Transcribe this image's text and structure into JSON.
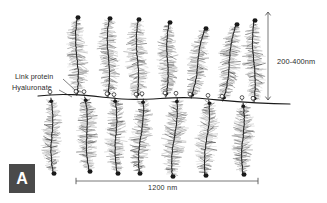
{
  "figure": {
    "panel_label": "A",
    "background_color": "#ffffff",
    "width": 327,
    "height": 203
  },
  "annotations": {
    "link_protein_label": "Link protein",
    "hyaluronate_label": "Hyaluronate",
    "vertical_scale_label": "200-400nm",
    "horizontal_scale_label": "1200 nm"
  },
  "colors": {
    "ink": "#1a1a1a",
    "bristle": "#8c8c8c",
    "core": "#262626",
    "scale_line": "#555555",
    "panel_box": "#4a4a4a",
    "panel_text": "#ffffff",
    "label_text": "#2b2b2b"
  },
  "scalebars": {
    "vertical": {
      "label": "200-400nm",
      "x": 268,
      "y_top": 12,
      "y_bottom": 100
    },
    "horizontal": {
      "label": "1200 nm",
      "y": 181,
      "x_left": 76,
      "x_right": 258
    }
  },
  "backbone": {
    "name": "hyaluronate-chain",
    "path": "M 38,96 C 70,92 96,97 122,99 C 150,101 170,96 196,98 C 222,100 248,104 290,104",
    "attachment_count": 14
  },
  "monomers": {
    "upper_count": 7,
    "lower_count": 7,
    "upper": [
      {
        "id": "upper-1",
        "base_x": 76,
        "base_y": 95,
        "top_x": 78,
        "top_y": 17,
        "tilt": 2,
        "bristle_span": 11
      },
      {
        "id": "upper-2",
        "base_x": 107,
        "base_y": 97,
        "top_x": 110,
        "top_y": 18,
        "tilt": 3,
        "bristle_span": 11
      },
      {
        "id": "upper-3",
        "base_x": 136,
        "base_y": 98,
        "top_x": 139,
        "top_y": 19,
        "tilt": 3,
        "bristle_span": 12
      },
      {
        "id": "upper-4",
        "base_x": 165,
        "base_y": 97,
        "top_x": 170,
        "top_y": 22,
        "tilt": 5,
        "bristle_span": 10
      },
      {
        "id": "upper-5",
        "base_x": 190,
        "base_y": 98,
        "top_x": 206,
        "top_y": 28,
        "tilt": 16,
        "bristle_span": 10
      },
      {
        "id": "upper-6",
        "base_x": 222,
        "base_y": 101,
        "top_x": 237,
        "top_y": 24,
        "tilt": 15,
        "bristle_span": 11
      },
      {
        "id": "upper-7",
        "base_x": 253,
        "base_y": 102,
        "top_x": 255,
        "top_y": 20,
        "tilt": 2,
        "bristle_span": 11
      }
    ],
    "lower": [
      {
        "id": "lower-1",
        "base_x": 50,
        "base_y": 98,
        "tip_x": 54,
        "tip_y": 174,
        "tilt": 4,
        "bristle_span": 10
      },
      {
        "id": "lower-2",
        "base_x": 84,
        "base_y": 97,
        "tip_x": 90,
        "tip_y": 172,
        "tilt": 6,
        "bristle_span": 11
      },
      {
        "id": "lower-3",
        "base_x": 114,
        "base_y": 98,
        "tip_x": 118,
        "tip_y": 174,
        "tilt": 4,
        "bristle_span": 11
      },
      {
        "id": "lower-4",
        "base_x": 142,
        "base_y": 99,
        "tip_x": 140,
        "tip_y": 174,
        "tilt": -2,
        "bristle_span": 11
      },
      {
        "id": "lower-5",
        "base_x": 176,
        "base_y": 98,
        "tip_x": 173,
        "tip_y": 177,
        "tilt": -3,
        "bristle_span": 12
      },
      {
        "id": "lower-6",
        "base_x": 208,
        "base_y": 100,
        "tip_x": 206,
        "tip_y": 176,
        "tilt": -2,
        "bristle_span": 11
      },
      {
        "id": "lower-7",
        "base_x": 242,
        "base_y": 103,
        "tip_x": 244,
        "tip_y": 175,
        "tilt": 2,
        "bristle_span": 11
      }
    ]
  }
}
